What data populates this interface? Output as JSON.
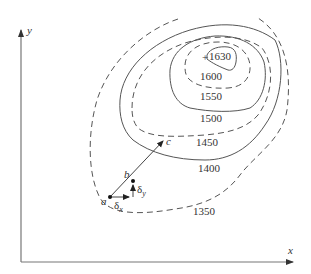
{
  "diagram": {
    "type": "contour map with gradient vector",
    "axes": {
      "x_label": "x",
      "y_label": "y"
    },
    "contours": [
      {
        "value": 1350,
        "label": "1350",
        "style": "dashed"
      },
      {
        "value": 1400,
        "label": "1400",
        "style": "solid"
      },
      {
        "value": 1450,
        "label": "1450",
        "style": "dashed"
      },
      {
        "value": 1500,
        "label": "1500",
        "style": "solid"
      },
      {
        "value": 1550,
        "label": "1550",
        "style": "dashed"
      },
      {
        "value": 1600,
        "label": "1600",
        "style": "solid"
      },
      {
        "value": 1630,
        "label": "1630",
        "style": "peak marker"
      }
    ],
    "points": {
      "a": "a",
      "b": "b",
      "c": "c"
    },
    "increments": {
      "dx": "δ",
      "dx_sub": "x",
      "dy": "δ",
      "dy_sub": "y"
    },
    "colors": {
      "line": "#555555",
      "axis": "#777777",
      "text": "#333333",
      "background": "#ffffff"
    }
  }
}
